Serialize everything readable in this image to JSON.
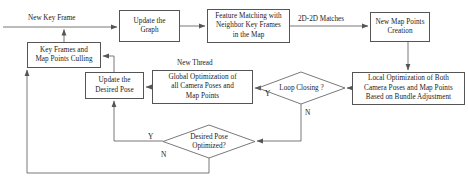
{
  "diagram": {
    "type": "flowchart",
    "nodes": [
      {
        "id": "update_graph",
        "shape": "rect",
        "label": "Update the\nGraph"
      },
      {
        "id": "feature_matching",
        "shape": "rect",
        "label": "Feature Matching with\nNeighbor Key Frames\nin the Map"
      },
      {
        "id": "new_map_points",
        "shape": "rect",
        "label": "New Map Points\nCreation"
      },
      {
        "id": "local_optimization",
        "shape": "rect",
        "label": "Local Optimization of Both\nCamera Poses and Map Points\nBased on Bundle Adjustment"
      },
      {
        "id": "loop_closing",
        "shape": "diamond",
        "label": "Loop Closing ?"
      },
      {
        "id": "global_optimization",
        "shape": "rect",
        "label": "Global Optimization of\nall Camera Poses and\nMap Points"
      },
      {
        "id": "update_desired_pose",
        "shape": "rect",
        "label": "Update the\nDesired Pose"
      },
      {
        "id": "culling",
        "shape": "rect",
        "label": "Key Frames and\nMap Points Culling"
      },
      {
        "id": "desired_pose_optimized",
        "shape": "diamond",
        "label": "Desired Pose\nOptimized?"
      }
    ],
    "node_labels": {
      "update_graph_line1": "Update the",
      "update_graph_line2": "Graph",
      "feature_matching_line1": "Feature Matching with",
      "feature_matching_line2": "Neighbor Key Frames",
      "feature_matching_line3": "in the Map",
      "new_map_points_line1": "New Map Points",
      "new_map_points_line2": "Creation",
      "local_optimization_line1": "Local Optimization of Both",
      "local_optimization_line2": "Camera Poses and Map Points",
      "local_optimization_line3": "Based on Bundle Adjustment",
      "global_optimization_line1": "Global Optimization of",
      "global_optimization_line2": "all Camera Poses and",
      "global_optimization_line3": "Map Points",
      "update_desired_pose_line1": "Update the",
      "update_desired_pose_line2": "Desired Pose",
      "culling_line1": "Key Frames and",
      "culling_line2": "Map Points Culling",
      "loop_closing_label": "Loop Closing ?",
      "desired_pose_line1": "Desired Pose",
      "desired_pose_line2": "Optimized?"
    },
    "edge_labels": {
      "new_key_frame": "New Key Frame",
      "matches": "2D-2D Matches",
      "new_thread": "New Thread",
      "loop_closing_yes": "Y",
      "loop_closing_no": "N",
      "desired_pose_yes": "Y",
      "desired_pose_no": "N"
    },
    "colors": {
      "stroke": "#555555",
      "background": "#ffffff",
      "text": "#1a1a1a"
    }
  }
}
